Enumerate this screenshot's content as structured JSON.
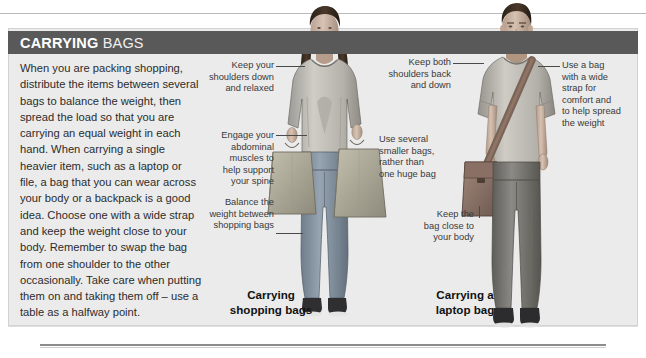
{
  "panel": {
    "title_bold": "CARRYING",
    "title_light": " BAGS",
    "body": "When you are packing shopping, distribute the items between several bags to balance the weight, then spread the load so that you are carrying an equal weight in each hand. When carrying a single heavier item, such as a laptop or file, a bag that you can wear across your body or a backpack is a good idea. Choose one with a wide strap and keep the weight close to your body. Remember to swap the bag from one shoulder to the other occasionally. Take care when putting them on and taking them off – use a table as a halfway point."
  },
  "annotations": {
    "shoulders_down": "Keep your\nshoulders down\nand relaxed",
    "engage_abdominal": "Engage your\nabdominal\nmuscles to\nhelp support\nyour spine",
    "balance_weight": "Balance the\nweight between\nshopping bags",
    "keep_both_shoulders": "Keep both\nshoulders back\nand down",
    "use_several_bags": "Use several\nsmaller bags,\nrather than\none huge bag",
    "keep_bag_close": "Keep the\nbag close to\nyour body",
    "use_wide_strap": "Use a bag\nwith a wide\nstrap for\ncomfort and\nto help spread\nthe weight"
  },
  "captions": {
    "left": "Carrying\nshopping bags",
    "right": "Carrying a\nlaptop bag"
  },
  "colors": {
    "panel_bg": "#ebebeb",
    "title_band": "#595959",
    "page_bg": "#ffffff",
    "text": "#2b2b2b",
    "note_text": "#3a3a3a"
  }
}
